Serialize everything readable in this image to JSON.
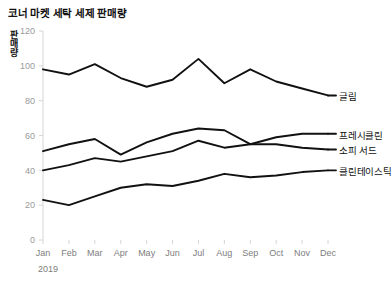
{
  "chart_data": {
    "type": "line",
    "title": "코너 마켓 세탁 세제 판매량",
    "xlabel": "2019",
    "ylabel": "판매량",
    "categories": [
      "Jan",
      "Feb",
      "Mar",
      "Apr",
      "May",
      "Jun",
      "Jul",
      "Aug",
      "Sep",
      "Oct",
      "Nov",
      "Dec"
    ],
    "ylim": [
      0,
      120
    ],
    "yticks": [
      0,
      20,
      40,
      60,
      80,
      100,
      120
    ],
    "ytick_labels": [
      "0",
      "20",
      "40",
      "60",
      "80",
      "100",
      "120"
    ],
    "grid": false,
    "legend": "right-inline-labels",
    "line_color": "#111111",
    "series": [
      {
        "name": "글림",
        "values": [
          98,
          95,
          101,
          93,
          88,
          92,
          104,
          90,
          98,
          91,
          87,
          83
        ]
      },
      {
        "name": "프레시클린",
        "values": [
          51,
          55,
          58,
          49,
          56,
          61,
          64,
          63,
          55,
          59,
          61,
          61
        ]
      },
      {
        "name": "소피 서드",
        "values": [
          40,
          43,
          47,
          45,
          48,
          51,
          57,
          53,
          55,
          55,
          53,
          52
        ]
      },
      {
        "name": "클린테이스틱",
        "values": [
          23,
          20,
          25,
          30,
          32,
          31,
          34,
          38,
          36,
          37,
          39,
          40
        ]
      }
    ]
  }
}
